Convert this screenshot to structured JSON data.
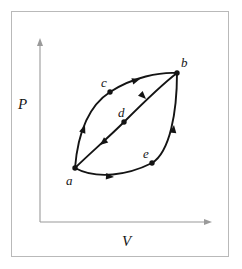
{
  "figure": {
    "kind": "pressure-volume-diagram",
    "axes": {
      "y_label": "P",
      "x_label": "V",
      "y_axis": {
        "x": 40,
        "y_top": 38,
        "y_bottom": 222
      },
      "x_axis": {
        "y": 222,
        "x_left": 40,
        "x_right": 212
      }
    },
    "colors": {
      "curve": "#141414",
      "axis": "#9a9a9a",
      "frame": "#b9b9b9",
      "background": "#ffffff"
    },
    "points": [
      {
        "id": "a",
        "label": "a",
        "x": 75,
        "y": 168,
        "label_x": 66,
        "label_y": 174
      },
      {
        "id": "b",
        "label": "b",
        "x": 177,
        "y": 73,
        "label_x": 181,
        "label_y": 56
      },
      {
        "id": "c",
        "label": "c",
        "x": 110,
        "y": 92,
        "label_x": 101,
        "label_y": 76
      },
      {
        "id": "d",
        "label": "d",
        "x": 124,
        "y": 122,
        "label_x": 118,
        "label_y": 106
      },
      {
        "id": "e",
        "label": "e",
        "x": 152,
        "y": 163,
        "label_x": 143,
        "label_y": 147
      }
    ],
    "paths": [
      {
        "id": "upper-path-a-c-b",
        "from": "a",
        "through": "c",
        "to": "b",
        "direction": "a-to-b",
        "d": "M 75 168 C 78 131, 90 105, 110 92 C 133 77, 160 72, 177 73",
        "arrows": [
          {
            "x": 85,
            "y": 125,
            "angle": -70
          },
          {
            "x": 140,
            "y": 79,
            "angle": -17
          }
        ]
      },
      {
        "id": "middle-path-b-d-a",
        "from": "b",
        "through": "d",
        "to": "a",
        "direction": "b-to-a",
        "d": "M 177 73 C 160 86, 142 104, 124 122 C 108 138, 88 155, 75 168",
        "arrows": [
          {
            "x": 146,
            "y": 99,
            "angle": 45
          },
          {
            "x": 100,
            "y": 145,
            "angle": 140
          }
        ]
      },
      {
        "id": "lower-path-a-e-b",
        "from": "a",
        "through": "e",
        "to": "b",
        "direction": "a-to-b",
        "d": "M 75 168 C 97 180, 128 175, 152 163 C 170 152, 177 112, 177 73",
        "arrows": [
          {
            "x": 114,
            "y": 177,
            "angle": 5
          },
          {
            "x": 174,
            "y": 125,
            "angle": -83
          }
        ]
      }
    ]
  }
}
